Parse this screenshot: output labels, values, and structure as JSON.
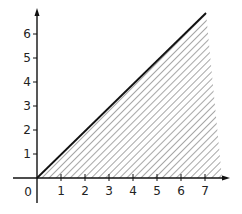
{
  "chart_data": {
    "type": "area",
    "title": "",
    "xlabel": "",
    "ylabel": "",
    "xlim": [
      0,
      7.5
    ],
    "ylim": [
      0,
      7
    ],
    "x_ticks": [
      "1",
      "2",
      "3",
      "4",
      "5",
      "6",
      "7"
    ],
    "y_ticks": [
      "1",
      "2",
      "3",
      "4",
      "5",
      "6"
    ],
    "origin_label": "0",
    "grid": false,
    "legend": null,
    "series": [
      {
        "name": "line y = x",
        "type": "line",
        "x": [
          0,
          7
        ],
        "y": [
          0,
          6.9
        ]
      }
    ],
    "shaded_region": {
      "description": "region below the line y = x, above the x-axis, hatched with diagonal lines",
      "vertices": [
        [
          0,
          0
        ],
        [
          7,
          6.9
        ],
        [
          7.6,
          0
        ]
      ],
      "fill": "diagonal-hatch"
    }
  },
  "colors": {
    "axis": "#111111",
    "line": "#111111",
    "hatch": "#777777",
    "background": "#ffffff"
  }
}
